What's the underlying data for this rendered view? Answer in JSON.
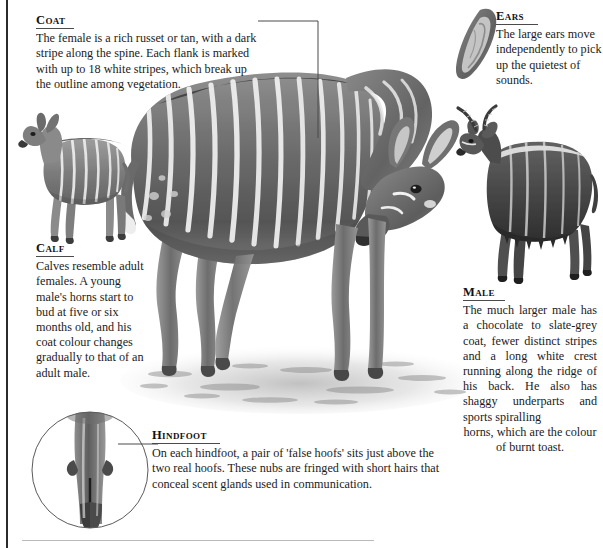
{
  "page": {
    "ink_color": "#1b1b1b",
    "rule_color": "#b9b9b9",
    "border_color": "#2b2b2b"
  },
  "callouts": [
    {
      "id": "coat",
      "heading": "Coat",
      "body": "The female is a rich russet or tan, with a dark stripe along the spine. Each flank is marked with up to 18 white stripes, which break up the outline among vegetation."
    },
    {
      "id": "ears",
      "heading": "Ears",
      "body": "The large ears move independently to pick up the quietest of sounds."
    },
    {
      "id": "calf",
      "heading": "Calf",
      "body": "Calves resemble adult females. A young male's horns start to bud at five or six months old, and his coat colour changes gradually to that of an adult male."
    },
    {
      "id": "male",
      "heading": "Male",
      "body": "The much larger male has a chocolate to slate-grey coat, fewer distinct stripes and a long white crest running along the ridge of his back. He also has shaggy underparts and sports spiralling",
      "body_tail": "horns, which are the colour of burnt toast."
    },
    {
      "id": "hindfoot",
      "heading": "Hindfoot",
      "body": "On each hindfoot, a pair of 'false hoofs' sits just above the two real hoofs. These nubs are fringed with short hairs that conceal scent glands used in communication."
    }
  ],
  "illustrations": [
    {
      "id": "female-nyala",
      "label": "adult female nyala, head turned back, striped flank"
    },
    {
      "id": "calf-nyala",
      "label": "nyala calf standing in profile"
    },
    {
      "id": "male-nyala",
      "label": "adult male nyala with spiral horns"
    },
    {
      "id": "ear-detail",
      "label": "close-up of a nyala ear"
    },
    {
      "id": "hindfoot-detail",
      "label": "circular vignette of a nyala hindfoot"
    }
  ]
}
